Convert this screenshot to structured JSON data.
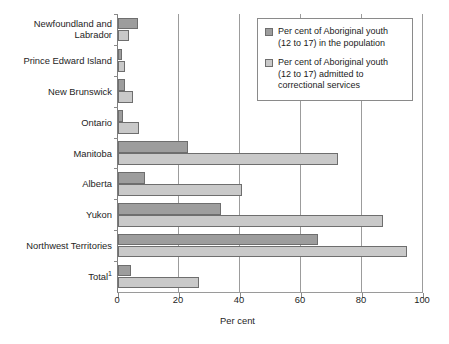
{
  "chart_data": {
    "type": "bar",
    "orientation": "horizontal",
    "title": "",
    "xlabel": "Per cent",
    "ylabel": "",
    "xlim": [
      0,
      100
    ],
    "xticks": [
      0,
      20,
      40,
      60,
      80,
      100
    ],
    "xtick_labels": [
      "0",
      "20",
      "40",
      "60",
      "80",
      "100"
    ],
    "grid": true,
    "grid_axis": "x",
    "legend_position": "top-right",
    "categories": [
      "Newfoundland and Labrador",
      "Prince Edward Island",
      "New Brunswick",
      "Ontario",
      "Manitoba",
      "Alberta",
      "Yukon",
      "Northwest Territories",
      "Total"
    ],
    "category_labels": [
      {
        "line1": "Newfoundland and",
        "line2": "Labrador",
        "footnote": ""
      },
      {
        "line1": "Prince Edward Island",
        "line2": "",
        "footnote": ""
      },
      {
        "line1": "New Brunswick",
        "line2": "",
        "footnote": ""
      },
      {
        "line1": "Ontario",
        "line2": "",
        "footnote": ""
      },
      {
        "line1": "Manitoba",
        "line2": "",
        "footnote": ""
      },
      {
        "line1": "Alberta",
        "line2": "",
        "footnote": ""
      },
      {
        "line1": "Yukon",
        "line2": "",
        "footnote": ""
      },
      {
        "line1": "Northwest Territories",
        "line2": "",
        "footnote": ""
      },
      {
        "line1": "Total",
        "line2": "",
        "footnote": "1"
      }
    ],
    "series": [
      {
        "name": "Per cent of Aboriginal youth (12 to 17) in the population",
        "key": "population",
        "color": "#9d9d9d",
        "values": [
          6.5,
          1.3,
          2.3,
          1.6,
          23.0,
          8.9,
          33.8,
          65.5,
          4.4
        ]
      },
      {
        "name": "Per cent of Aboriginal youth (12 to 17) admitted to correctional services",
        "key": "admitted",
        "color": "#c9c9c9",
        "values": [
          3.6,
          2.4,
          5.0,
          6.9,
          72.0,
          40.6,
          87.0,
          94.7,
          26.7
        ]
      }
    ]
  },
  "legend": {
    "items": [
      {
        "color": "#9d9d9d",
        "line1": "Per cent of Aboriginal youth",
        "line2": "(12 to 17) in the population"
      },
      {
        "color": "#c9c9c9",
        "line1": "Per cent of Aboriginal youth",
        "line2": "(12 to 17) admitted to",
        "line3": "correctional services"
      }
    ]
  },
  "axis": {
    "x_title": "Per cent"
  }
}
